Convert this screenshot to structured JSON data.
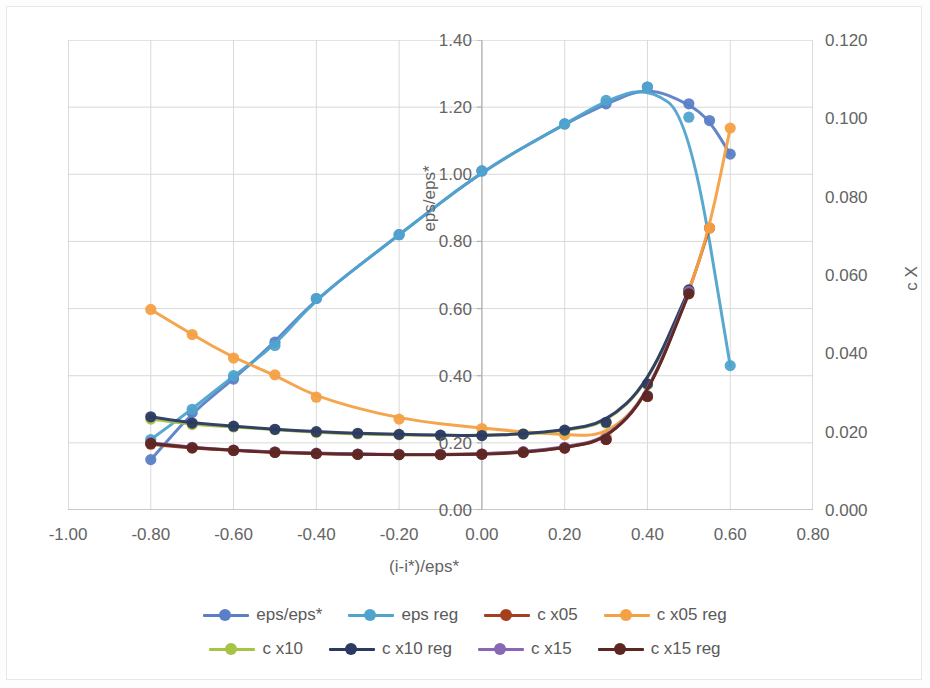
{
  "chart_data": {
    "type": "line",
    "title": "",
    "xlabel": "(i-i*)/eps*",
    "ylabel": "eps/eps*",
    "y2label": "c X",
    "xlim": [
      -1.0,
      0.8
    ],
    "ylim": [
      0.0,
      1.4
    ],
    "y2lim": [
      0.0,
      0.12
    ],
    "grid": true,
    "legend_position": "bottom",
    "xticks": [
      "-1.00",
      "-0.80",
      "-0.60",
      "-0.40",
      "-0.20",
      "0.00",
      "0.20",
      "0.40",
      "0.60",
      "0.80"
    ],
    "xtick_values": [
      -1.0,
      -0.8,
      -0.6,
      -0.4,
      -0.2,
      0.0,
      0.2,
      0.4,
      0.6,
      0.8
    ],
    "yticks": [
      "0.00",
      "0.20",
      "0.40",
      "0.60",
      "0.80",
      "1.00",
      "1.20",
      "1.40"
    ],
    "ytick_values": [
      0.0,
      0.2,
      0.4,
      0.6,
      0.8,
      1.0,
      1.2,
      1.4
    ],
    "y2ticks": [
      "0.000",
      "0.020",
      "0.040",
      "0.060",
      "0.080",
      "0.100",
      "0.120"
    ],
    "y2tick_values": [
      0.0,
      0.02,
      0.04,
      0.06,
      0.08,
      0.1,
      0.12
    ],
    "series": [
      {
        "name": "eps/eps*",
        "color": "#5b7fc7",
        "axis": "left",
        "x": [
          -0.8,
          -0.7,
          -0.6,
          -0.5,
          -0.4,
          -0.2,
          0.0,
          0.2,
          0.3,
          0.4,
          0.5,
          0.55,
          0.6
        ],
        "values": [
          0.15,
          0.29,
          0.39,
          0.5,
          0.63,
          0.82,
          1.01,
          1.15,
          1.21,
          1.26,
          1.21,
          1.16,
          1.06
        ]
      },
      {
        "name": "eps reg",
        "color": "#4fa3cd",
        "axis": "left",
        "x": [
          -0.8,
          -0.7,
          -0.6,
          -0.5,
          -0.4,
          -0.2,
          0.0,
          0.2,
          0.3,
          0.4,
          0.5,
          0.6
        ],
        "values": [
          0.21,
          0.3,
          0.4,
          0.49,
          0.63,
          0.82,
          1.01,
          1.15,
          1.22,
          1.26,
          1.17,
          0.43
        ]
      },
      {
        "name": "c x05",
        "color": "#a5401f",
        "axis": "right",
        "x": [
          -0.8,
          -0.7,
          -0.6,
          -0.5,
          -0.4,
          -0.3,
          -0.2,
          -0.1,
          0.0,
          0.1,
          0.2,
          0.3,
          0.4,
          0.5,
          0.55
        ],
        "values": [
          0.0168,
          0.0158,
          0.0152,
          0.0148,
          0.0144,
          0.0142,
          0.0142,
          0.0142,
          0.0143,
          0.0148,
          0.0158,
          0.018,
          0.029,
          0.0555,
          0.072
        ]
      },
      {
        "name": "c x05 reg",
        "color": "#f4a045",
        "axis": "right",
        "x": [
          -0.8,
          -0.7,
          -0.6,
          -0.5,
          -0.4,
          -0.2,
          0.0,
          0.2,
          0.3,
          0.4,
          0.5,
          0.55,
          0.6
        ],
        "values": [
          0.0512,
          0.0448,
          0.0388,
          0.0345,
          0.0288,
          0.0232,
          0.0208,
          0.0192,
          0.019,
          0.029,
          0.0555,
          0.072,
          0.0975
        ]
      },
      {
        "name": "c x10",
        "color": "#a7c346",
        "axis": "right",
        "x": [
          -0.8,
          -0.7,
          -0.6,
          -0.5,
          -0.4,
          -0.3,
          -0.2,
          -0.1,
          0.0,
          0.1,
          0.2,
          0.3,
          0.4,
          0.5
        ],
        "values": [
          0.0232,
          0.0218,
          0.0212,
          0.0205,
          0.0198,
          0.0194,
          0.0192,
          0.019,
          0.019,
          0.0194,
          0.0202,
          0.0222,
          0.032,
          0.056
        ]
      },
      {
        "name": "c x10 reg",
        "color": "#2b3a63",
        "axis": "right",
        "x": [
          -0.8,
          -0.7,
          -0.6,
          -0.5,
          -0.4,
          -0.3,
          -0.2,
          -0.1,
          0.0,
          0.1,
          0.2,
          0.3,
          0.4,
          0.5
        ],
        "values": [
          0.0238,
          0.0222,
          0.0214,
          0.0206,
          0.02,
          0.0196,
          0.0193,
          0.0191,
          0.019,
          0.0194,
          0.0204,
          0.0224,
          0.0322,
          0.0562
        ]
      },
      {
        "name": "c x15",
        "color": "#8967b5",
        "axis": "right",
        "x": [
          -0.8,
          -0.7,
          -0.6,
          -0.5,
          -0.4,
          -0.3,
          -0.2,
          -0.1,
          0.0,
          0.1,
          0.2,
          0.3,
          0.4,
          0.5
        ],
        "values": [
          0.0172,
          0.016,
          0.0153,
          0.0148,
          0.0145,
          0.0143,
          0.0142,
          0.0142,
          0.0143,
          0.0149,
          0.016,
          0.0182,
          0.0292,
          0.0558
        ]
      },
      {
        "name": "c x15 reg",
        "color": "#5e2620",
        "axis": "right",
        "x": [
          -0.8,
          -0.7,
          -0.6,
          -0.5,
          -0.4,
          -0.3,
          -0.2,
          -0.1,
          0.0,
          0.1,
          0.2,
          0.3,
          0.4,
          0.5
        ],
        "values": [
          0.017,
          0.0159,
          0.0152,
          0.0147,
          0.0144,
          0.0142,
          0.0141,
          0.0141,
          0.0142,
          0.0147,
          0.0158,
          0.018,
          0.029,
          0.0552
        ]
      }
    ]
  },
  "legend": {
    "row1": [
      {
        "label": "eps/eps*",
        "color": "#5b7fc7"
      },
      {
        "label": "eps reg",
        "color": "#4fa3cd"
      },
      {
        "label": "c x05",
        "color": "#a5401f"
      },
      {
        "label": "c x05 reg",
        "color": "#f4a045"
      }
    ],
    "row2": [
      {
        "label": "c x10",
        "color": "#a7c346"
      },
      {
        "label": "c x10 reg",
        "color": "#2b3a63"
      },
      {
        "label": "c x15",
        "color": "#8967b5"
      },
      {
        "label": "c x15 reg",
        "color": "#5e2620"
      }
    ]
  }
}
